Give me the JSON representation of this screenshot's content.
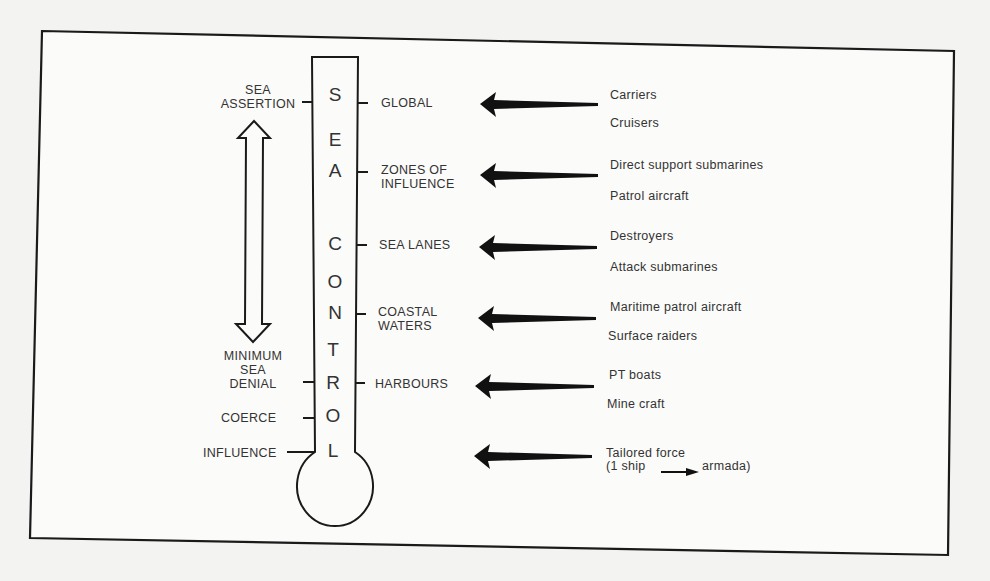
{
  "diagram": {
    "title_fragment": "requirements",
    "thermometer_letters": [
      "S",
      "E",
      "A",
      "C",
      "O",
      "N",
      "T",
      "R",
      "O",
      "L"
    ],
    "left_scale": {
      "top_label": [
        "SEA",
        "ASSERTION"
      ],
      "bottom_label": [
        "MINIMUM",
        "SEA",
        "DENIAL"
      ],
      "coerce": "COERCE",
      "influence": "INFLUENCE",
      "double_arrow": "sea-assertion-to-minimum-sea-denial"
    },
    "levels": [
      {
        "label": [
          "GLOBAL"
        ],
        "forces": [
          "Carriers",
          "Cruisers"
        ]
      },
      {
        "label": [
          "ZONES OF",
          "INFLUENCE"
        ],
        "forces": [
          "Direct support submarines",
          "Patrol aircraft"
        ]
      },
      {
        "label": [
          "SEA LANES"
        ],
        "forces": [
          "Destroyers",
          "Attack submarines"
        ]
      },
      {
        "label": [
          "COASTAL",
          "WATERS"
        ],
        "forces": [
          "Maritime patrol aircraft",
          "Surface raiders"
        ]
      },
      {
        "label": [
          "HARBOURS"
        ],
        "forces": [
          "PT boats",
          "Mine craft"
        ]
      },
      {
        "label": [],
        "forces": [
          "Tailored force",
          "(1 ship",
          "armada)"
        ]
      }
    ],
    "colors": {
      "ink": "#1a1a1a",
      "paper": "#f3f3f1",
      "text": "#333333"
    }
  }
}
